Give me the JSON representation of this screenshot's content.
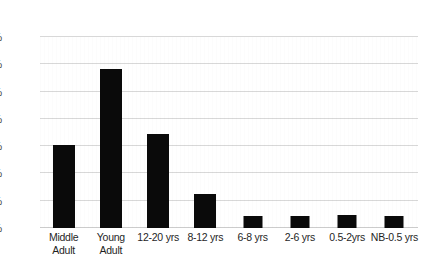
{
  "chart_data": {
    "type": "bar",
    "title": "",
    "subtitle": "",
    "xlabel": "",
    "ylabel": "",
    "categories": [
      "Middle\nAdult",
      "Young\nAdult",
      "12-20 yrs",
      "8-12 yrs",
      "6-8 yrs",
      "2-6 yrs",
      "0.5-2yrs",
      "NB-0.5 yrs"
    ],
    "values": [
      15.2,
      29.1,
      17.2,
      6.2,
      2.2,
      2.2,
      2.3,
      2.2
    ],
    "value_labels": [
      "",
      "",
      "",
      "",
      "",
      "",
      "",
      ""
    ],
    "ylim": [
      0,
      35
    ],
    "ytick_values": [
      0,
      5,
      10,
      15,
      20,
      25,
      30,
      35
    ],
    "ytick_labels": [
      "0%",
      "5%",
      "10%",
      "15%",
      "20%",
      "25%",
      "30%",
      "35%"
    ],
    "grid": true,
    "grid_axis": "y",
    "legend": false,
    "legend_position": "none",
    "bar_color": "#0a0a0a",
    "gridline_color": "#d6d6d6",
    "background_color": "#ffffff",
    "axis_text_color": "#1f1f1f"
  }
}
